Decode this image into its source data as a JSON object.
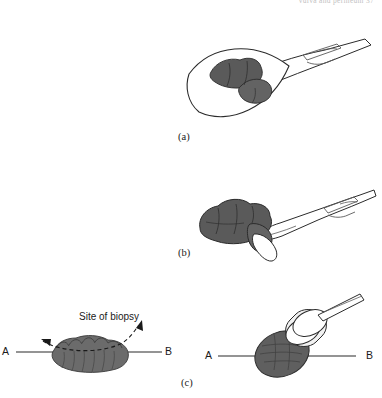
{
  "page": {
    "running_head": "vulva and perineum   37",
    "background_color": "#ffffff",
    "width": 382,
    "height": 398
  },
  "figure": {
    "type": "medical-illustration",
    "ink_color": "#1a1a1a",
    "lesion_fill": "#5a5a5a",
    "lesion_fill_light": "#6e6e6e",
    "instrument_fill": "#ffffff"
  },
  "panels": [
    {
      "id": "a",
      "label": "(a)",
      "description": "Excisional biopsy: scalpel above an elliptical skin excision containing a pigmented lesion",
      "instrument": "scalpel",
      "specimen": "elliptical excision with lesion"
    },
    {
      "id": "b",
      "label": "(b)",
      "description": "Incisional biopsy: scalpel cutting a wedge from the edge of a large pigmented lesion",
      "instrument": "scalpel",
      "specimen": "wedge of lesion"
    },
    {
      "id": "c",
      "label": "(c)",
      "description": "Punch biopsy: cross-section A to B through a raised lesion, with punch tool taking a core",
      "instrument": "punch-biopsy-tool",
      "specimen": "punch core"
    }
  ],
  "annotations": {
    "site_of_biopsy": "Site of biopsy",
    "endpoint_a": "A",
    "endpoint_b": "B"
  }
}
